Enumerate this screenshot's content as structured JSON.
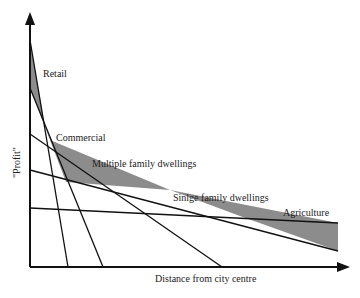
{
  "diagram": {
    "title": "",
    "y_axis_label": "\"Profit\"",
    "x_axis_label": "Distance from city centre",
    "curves": [
      {
        "name": "Retail",
        "label": "Retail"
      },
      {
        "name": "Commercial",
        "label": "Commercial"
      },
      {
        "name": "Multiple family dwellings",
        "label": "Multiple family dwellings"
      },
      {
        "name": "Single family dwellings",
        "label": "Sinlge family dwellings"
      },
      {
        "name": "Agriculture",
        "label": "Agriculture"
      }
    ],
    "colors": {
      "line": "#111111",
      "shade": "#8c8c8c",
      "background": "#ffffff"
    }
  }
}
